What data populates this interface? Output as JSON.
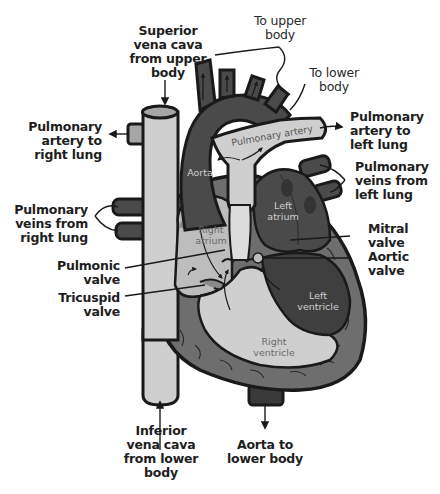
{
  "diagram": {
    "colors": {
      "background": "#ffffff",
      "outline": "#1a1a1a",
      "deoxygenated_light": "#cfcfcf",
      "mid_gray": "#8a8a8a",
      "dark_oxygenated": "#4a4a4a",
      "muscle": "#6e6e6e",
      "label_text": "#1e1e1e"
    },
    "external_labels": {
      "superior_vena_cava": "Superior\nvena cava\nfrom upper\nbody",
      "to_upper_body": "To upper\nbody",
      "to_lower_body": "To lower\nbody",
      "pulmonary_artery_right": "Pulmonary\nartery to\nright lung",
      "pulmonary_artery_left": "Pulmonary\nartery to\nleft lung",
      "pulmonary_veins_left": "Pulmonary\nveins from\nleft lung",
      "pulmonary_veins_right": "Pulmonary\nveins from\nright lung",
      "mitral_valve": "Mitral\nvalve",
      "aortic_valve": "Aortic\nvalve",
      "pulmonic_valve": "Pulmonic\nvalve",
      "tricuspid_valve": "Tricuspid\nvalve",
      "inferior_vena_cava": "Inferior\nvena cava\nfrom lower\nbody",
      "aorta_lower_body": "Aorta to\nlower body"
    },
    "internal_labels": {
      "pulmonary_artery": "Pulmonary artery",
      "aorta": "Aorta",
      "left_atrium": "Left\natrium",
      "right_atrium": "Right\natrium",
      "left_ventricle": "Left\nventricle",
      "right_ventricle": "Right\nventricle"
    }
  }
}
